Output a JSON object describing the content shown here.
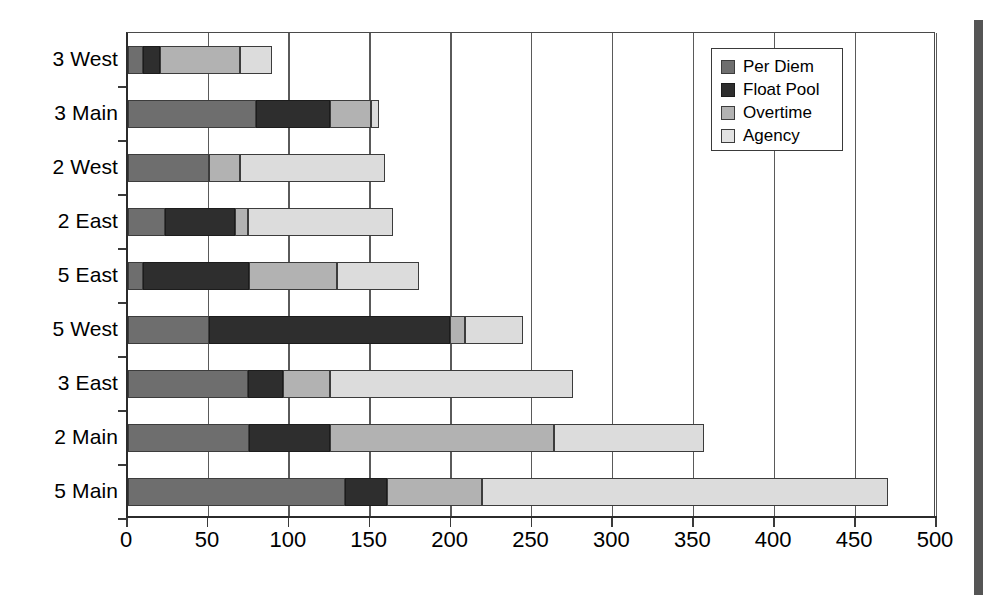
{
  "chart_data": {
    "type": "bar",
    "orientation": "horizontal",
    "stacked": true,
    "title": "",
    "xlabel": "",
    "ylabel": "",
    "xlim": [
      0,
      500
    ],
    "xticks": [
      0,
      50,
      100,
      150,
      200,
      250,
      300,
      350,
      400,
      450,
      500
    ],
    "grid": "vertical",
    "legend_position": "top-right",
    "categories": [
      "3 West",
      "3 Main",
      "2 West",
      "2 East",
      "5 East",
      "5 West",
      "3 East",
      "2 Main",
      "5 Main"
    ],
    "series": [
      {
        "name": "Per Diem",
        "color": "#6e6e6e",
        "values": [
          9,
          79,
          50,
          23,
          9,
          50,
          74,
          75,
          134
        ]
      },
      {
        "name": "Float Pool",
        "color": "#2e2e2e",
        "values": [
          11,
          46,
          0,
          43,
          66,
          149,
          22,
          50,
          26
        ]
      },
      {
        "name": "Overtime",
        "color": "#b2b2b2",
        "values": [
          49,
          25,
          19,
          8,
          54,
          9,
          29,
          138,
          59
        ]
      },
      {
        "name": "Agency",
        "color": "#dcdcdc",
        "values": [
          20,
          5,
          90,
          90,
          51,
          36,
          150,
          93,
          251
        ]
      }
    ],
    "totals": [
      89,
      155,
      159,
      164,
      180,
      244,
      275,
      356,
      470
    ]
  },
  "legend": {
    "items": [
      {
        "label": "Per Diem"
      },
      {
        "label": "Float Pool"
      },
      {
        "label": "Overtime"
      },
      {
        "label": "Agency"
      }
    ]
  },
  "axis": {
    "x_tick_labels": [
      "0",
      "50",
      "100",
      "150",
      "200",
      "250",
      "300",
      "350",
      "400",
      "450",
      "500"
    ],
    "y_tick_labels": [
      "3 West",
      "3 Main",
      "2 West",
      "2 East",
      "5 East",
      "5 West",
      "3 East",
      "2 Main",
      "5 Main"
    ]
  }
}
